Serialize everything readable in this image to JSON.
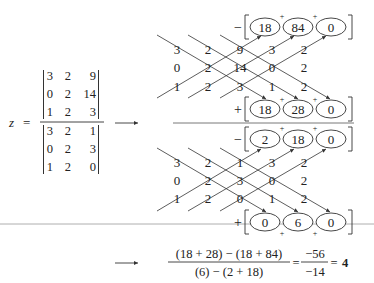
{
  "lhs": {
    "variable": "z",
    "equals": "=",
    "numerator": [
      [
        "3",
        "2",
        "9"
      ],
      [
        "0",
        "2",
        "14"
      ],
      [
        "1",
        "2",
        "3"
      ]
    ],
    "denominator": [
      [
        "3",
        "2",
        "1"
      ],
      [
        "0",
        "2",
        "3"
      ],
      [
        "1",
        "2",
        "0"
      ]
    ]
  },
  "arrows": {
    "first": "→",
    "second": "→"
  },
  "top_scheme": {
    "minus_sign": "−",
    "plus_sign": "+",
    "minus_terms": [
      "18",
      "84",
      "0"
    ],
    "plus_terms": [
      "18",
      "28",
      "0"
    ],
    "rows": [
      [
        "3",
        "2",
        "9",
        "3",
        "2"
      ],
      [
        "0",
        "2",
        "14",
        "0",
        "2"
      ],
      [
        "1",
        "2",
        "3",
        "1",
        "2"
      ]
    ],
    "plus_markers": [
      "+",
      "+"
    ]
  },
  "bottom_scheme": {
    "minus_sign": "−",
    "plus_sign": "+",
    "minus_terms": [
      "2",
      "18",
      "0"
    ],
    "plus_terms": [
      "0",
      "6",
      "0"
    ],
    "rows": [
      [
        "3",
        "2",
        "1",
        "3",
        "2"
      ],
      [
        "0",
        "2",
        "3",
        "0",
        "2"
      ],
      [
        "1",
        "2",
        "0",
        "1",
        "2"
      ]
    ],
    "plus_markers": [
      "+",
      "+"
    ]
  },
  "result": {
    "numerator": "(18 + 28) − (18 + 84)",
    "denominator": "(6) − (2 + 18)",
    "eq1": "=",
    "frac_num": "−56",
    "frac_den": "−14",
    "eq2": "=",
    "answer": "4"
  }
}
